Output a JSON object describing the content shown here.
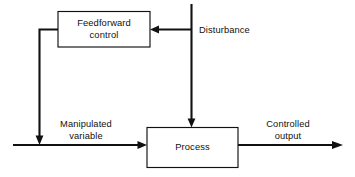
{
  "diagram": {
    "type": "block-diagram",
    "blocks": [
      {
        "id": "feedforward-control",
        "label_line1": "Feedforward",
        "label_line2": "control"
      },
      {
        "id": "process",
        "label": "Process"
      }
    ],
    "signals": [
      {
        "id": "disturbance",
        "label": "Disturbance"
      },
      {
        "id": "manipulated-variable",
        "label_line1": "Manipulated",
        "label_line2": "variable"
      },
      {
        "id": "controlled-output",
        "label_line1": "Controlled",
        "label_line2": "output"
      }
    ],
    "colors": {
      "line": "#111111",
      "background": "#ffffff",
      "box_fill": "#ffffff"
    }
  }
}
